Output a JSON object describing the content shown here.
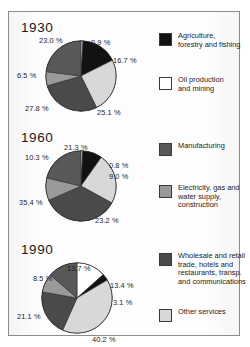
{
  "figure": {
    "border_color": "#8d8d8d",
    "background": "#fdfdfd"
  },
  "legend": {
    "position": "right",
    "items": [
      {
        "label_lines": [
          "Agriculture,",
          "forestry and fishing"
        ],
        "color": "#121212",
        "swatch_name": "legend-swatch-agriculture"
      },
      {
        "label_lines": [
          "Oil production",
          "and mining"
        ],
        "color": "#ffffff",
        "swatch_name": "legend-swatch-oil"
      },
      {
        "label_lines": [
          "Manufacturing"
        ],
        "color": "#585858",
        "swatch_name": "legend-swatch-manufacturing"
      },
      {
        "label_lines": [
          "Electricity, gas and",
          "water supply,",
          "construction"
        ],
        "color": "#9a9a9a",
        "swatch_name": "legend-swatch-electricity"
      },
      {
        "label_lines": [
          "Wholesale and retail",
          "trade, hotels and",
          "restaurants, transp.",
          "and communications"
        ],
        "color": "#4a4a4a",
        "swatch_name": "legend-swatch-wholesale"
      },
      {
        "label_lines": [
          "Other services"
        ],
        "color": "#d8d8d8",
        "swatch_name": "legend-swatch-other"
      }
    ]
  },
  "chart_data": [
    {
      "type": "pie",
      "title": "1930",
      "categories": [
        "Oil production and mining",
        "Agriculture, forestry and fishing",
        "Other services",
        "Wholesale and retail trade, hotels and restaurants, transp. and communications",
        "Electricity, gas and water supply, construction",
        "Manufacturing"
      ],
      "values": [
        0.9,
        16.7,
        25.1,
        27.8,
        6.5,
        23.0
      ],
      "colors": [
        "#ffffff",
        "#121212",
        "#d8d8d8",
        "#4a4a4a",
        "#9a9a9a",
        "#585858"
      ],
      "labels": [
        "0.9 %",
        "16.7 %",
        "25.1 %",
        "27.8 %",
        "6.5 %",
        "23.0 %"
      ],
      "units": "percent",
      "legend": "shared"
    },
    {
      "type": "pie",
      "title": "1960",
      "categories": [
        "Oil production and mining",
        "Agriculture, forestry and fishing",
        "Other services",
        "Wholesale and retail trade, hotels and restaurants, transp. and communications",
        "Electricity, gas and water supply, construction",
        "Manufacturing"
      ],
      "values": [
        0.8,
        9.0,
        23.2,
        35.4,
        10.3,
        21.3
      ],
      "colors": [
        "#ffffff",
        "#121212",
        "#d8d8d8",
        "#4a4a4a",
        "#9a9a9a",
        "#585858"
      ],
      "labels": [
        "0.8 %",
        "9.0 %",
        "23.2 %",
        "35.4 %",
        "10.3 %",
        "21.3 %"
      ],
      "units": "percent",
      "legend": "shared"
    },
    {
      "type": "pie",
      "title": "1990",
      "categories": [
        "Oil production and mining",
        "Agriculture, forestry and fishing",
        "Other services",
        "Wholesale and retail trade, hotels and restaurants, transp. and communications",
        "Electricity, gas and water supply, construction",
        "Manufacturing"
      ],
      "values": [
        13.4,
        3.1,
        40.2,
        21.1,
        8.5,
        13.7
      ],
      "colors": [
        "#ffffff",
        "#121212",
        "#d8d8d8",
        "#4a4a4a",
        "#9a9a9a",
        "#585858"
      ],
      "labels": [
        "13.4 %",
        "3.1 %",
        "40.2 %",
        "21.1 %",
        "8.5 %",
        "13.7 %"
      ],
      "units": "percent",
      "legend": "shared"
    }
  ],
  "panels": [
    {
      "year": "1930",
      "label_positions": [
        {
          "text": "0.9 %",
          "x": 82,
          "y": 26
        },
        {
          "text": "16.7 %",
          "x": 104,
          "y": 44
        },
        {
          "text": "25.1 %",
          "x": 88,
          "y": 96
        },
        {
          "text": "27.8 %",
          "x": 16,
          "y": 92
        },
        {
          "text": "6.5 %",
          "x": 8,
          "y": 59
        },
        {
          "text": "23.0 %",
          "x": 30,
          "y": 24
        }
      ]
    },
    {
      "year": "1960",
      "label_positions": [
        {
          "text": "0.8 %",
          "x": 100,
          "y": 149
        },
        {
          "text": "9.0 %",
          "x": 100,
          "y": 160
        },
        {
          "text": "23.2 %",
          "x": 86,
          "y": 204
        },
        {
          "text": "35.4 %",
          "x": 10,
          "y": 186
        },
        {
          "text": "10.3 %",
          "x": 16,
          "y": 141
        },
        {
          "text": "21.3 %",
          "x": 55,
          "y": 131
        }
      ]
    },
    {
      "year": "1990",
      "label_positions": [
        {
          "text": "13.4 %",
          "x": 101,
          "y": 269
        },
        {
          "text": "3.1 %",
          "x": 104,
          "y": 286
        },
        {
          "text": "40.2 %",
          "x": 83,
          "y": 323
        },
        {
          "text": "21.1 %",
          "x": 8,
          "y": 300
        },
        {
          "text": "8.5 %",
          "x": 24,
          "y": 262
        },
        {
          "text": "13.7 %",
          "x": 58,
          "y": 252
        }
      ]
    }
  ]
}
